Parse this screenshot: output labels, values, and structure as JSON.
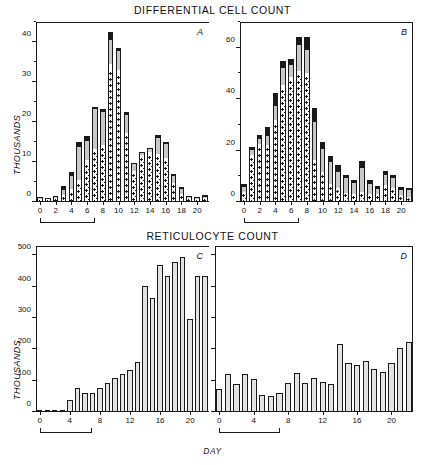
{
  "figure": {
    "top_title": "DIFFERENTIAL CELL COUNT",
    "bottom_title": "RETICULOCYTE COUNT",
    "ylabel_top": "THOUSANDS",
    "ylabel_bottom": "THOUSANDS",
    "xlabel": "DAY",
    "panel_letters": {
      "a": "A",
      "b": "B",
      "c": "C",
      "d": "D"
    }
  },
  "chart_data": [
    {
      "type": "bar",
      "panel": "A",
      "title": "DIFFERENTIAL CELL COUNT",
      "xlabel": "DAY",
      "ylabel": "THOUSANDS",
      "stacked": true,
      "ylim": [
        0,
        45
      ],
      "yticks": [
        0,
        10,
        20,
        30,
        40
      ],
      "yticks_minor": [
        5,
        15,
        25,
        35,
        45
      ],
      "xlim": [
        -0.5,
        21.5
      ],
      "x": [
        0,
        1,
        2,
        3,
        4,
        5,
        6,
        7,
        8,
        9,
        10,
        11,
        12,
        13,
        14,
        15,
        16,
        17,
        18,
        19,
        20,
        21
      ],
      "xticks": [
        0,
        2,
        4,
        6,
        8,
        10,
        12,
        14,
        16,
        18,
        20
      ],
      "grid": false,
      "legend": "none",
      "series": [
        {
          "name": "segment-1-checkered",
          "fill": "checkered",
          "values": [
            0.6,
            0.5,
            0.7,
            1.2,
            2.3,
            4.4,
            9.2,
            12.4,
            13.6,
            32.4,
            31.4,
            16.4,
            7.0,
            11.0,
            11.6,
            11.2,
            10.2,
            4.2,
            1.6,
            0.8,
            0.6,
            0.8
          ]
        },
        {
          "name": "segment-2-white",
          "fill": "white",
          "values": [
            0.2,
            0.2,
            0.3,
            0.5,
            0.9,
            1.0,
            1.2,
            0.8,
            0.6,
            2.0,
            1.6,
            0.8,
            0.8,
            0.7,
            0.9,
            0.9,
            0.8,
            0.6,
            0.4,
            0.2,
            0.2,
            0.2
          ]
        },
        {
          "name": "segment-3-gray",
          "fill": "gray",
          "values": [
            0.2,
            0.2,
            0.3,
            1.3,
            3.2,
            8.4,
            4.8,
            10.0,
            8.4,
            6.2,
            4.8,
            4.6,
            1.6,
            0.5,
            0.7,
            3.8,
            3.6,
            1.8,
            1.2,
            0.2,
            0.2,
            0.2
          ]
        },
        {
          "name": "segment-4-black",
          "fill": "black",
          "values": [
            0.2,
            0.2,
            0.2,
            0.9,
            1.1,
            1.1,
            1.2,
            0.6,
            0.6,
            1.8,
            0.6,
            0.8,
            0.4,
            0.3,
            0.4,
            0.8,
            0.4,
            0.4,
            0.6,
            0.2,
            0.2,
            0.5
          ]
        }
      ],
      "totals": [
        1.2,
        1.1,
        1.5,
        3.9,
        7.5,
        14.9,
        16.4,
        23.8,
        23.2,
        42.4,
        38.4,
        22.6,
        9.8,
        12.5,
        13.6,
        16.7,
        15.0,
        7.0,
        3.8,
        1.4,
        1.2,
        1.7
      ],
      "bracket": {
        "from": 0,
        "to": 7
      }
    },
    {
      "type": "bar",
      "panel": "B",
      "title": "DIFFERENTIAL CELL COUNT",
      "xlabel": "DAY",
      "ylabel": "THOUSANDS",
      "stacked": true,
      "ylim": [
        0,
        70
      ],
      "yticks": [
        0,
        20,
        40,
        60
      ],
      "yticks_minor": [
        10,
        30,
        50,
        70
      ],
      "xlim": [
        -0.5,
        21.5
      ],
      "x": [
        0,
        1,
        2,
        3,
        4,
        5,
        6,
        7,
        8,
        9,
        10,
        11,
        12,
        13,
        14,
        15,
        16,
        17,
        18,
        19,
        20,
        21
      ],
      "xticks": [
        0,
        2,
        4,
        6,
        8,
        10,
        12,
        14,
        16,
        18,
        20
      ],
      "grid": false,
      "legend": "none",
      "series": [
        {
          "name": "segment-1-checkered",
          "fill": "checkered",
          "values": [
            3.2,
            17.0,
            21.0,
            21.0,
            30.0,
            43.5,
            47.0,
            49.5,
            48.5,
            15.0,
            10.5,
            6.0,
            4.5,
            3.0,
            2.5,
            3.0,
            2.5,
            2.5,
            5.5,
            4.5,
            2.0,
            1.5
          ]
        },
        {
          "name": "segment-2-white",
          "fill": "white",
          "values": [
            0.8,
            1.2,
            1.5,
            1.2,
            2.0,
            2.0,
            1.8,
            1.6,
            1.8,
            1.5,
            1.2,
            1.0,
            0.8,
            0.7,
            0.6,
            0.8,
            0.7,
            0.6,
            1.0,
            0.9,
            0.6,
            0.5
          ]
        },
        {
          "name": "segment-3-gray",
          "fill": "gray",
          "values": [
            1.8,
            2.2,
            2.0,
            3.5,
            5.5,
            6.5,
            4.5,
            10.0,
            9.0,
            14.5,
            9.0,
            8.5,
            6.5,
            5.5,
            4.2,
            9.5,
            4.0,
            2.0,
            4.2,
            4.0,
            2.0,
            2.5
          ]
        },
        {
          "name": "segment-4-black",
          "fill": "black",
          "values": [
            1.2,
            1.1,
            1.5,
            3.3,
            5.0,
            3.0,
            2.2,
            3.0,
            5.0,
            5.5,
            2.8,
            2.5,
            2.5,
            1.3,
            1.2,
            2.7,
            1.3,
            1.2,
            1.3,
            1.1,
            1.2,
            1.0
          ]
        }
      ],
      "totals": [
        7.0,
        21.5,
        26.0,
        29.0,
        42.5,
        55.0,
        55.5,
        64.1,
        64.3,
        36.5,
        23.5,
        18.0,
        14.3,
        10.5,
        8.5,
        16.0,
        8.5,
        6.3,
        12.0,
        10.5,
        5.8,
        5.5
      ],
      "bracket": {
        "from": 0,
        "to": 7
      }
    },
    {
      "type": "bar",
      "panel": "C",
      "title": "RETICULOCYTE COUNT",
      "xlabel": "DAY",
      "ylabel": "THOUSANDS",
      "stacked": false,
      "ylim": [
        0,
        530
      ],
      "yticks": [
        0,
        100,
        200,
        300,
        400,
        500
      ],
      "xlim": [
        -0.5,
        21.5
      ],
      "x": [
        0,
        1,
        2,
        3,
        4,
        5,
        6,
        7,
        8,
        9,
        10,
        11,
        12,
        13,
        14,
        15,
        16,
        17,
        18,
        19,
        20,
        21
      ],
      "xticks": [
        0,
        4,
        8,
        12,
        16,
        20
      ],
      "grid": false,
      "legend": "none",
      "values": [
        2,
        2,
        2,
        8,
        38,
        78,
        62,
        62,
        78,
        92,
        110,
        122,
        135,
        160,
        402,
        365,
        470,
        435,
        478,
        495,
        298,
        433,
        435
      ],
      "bracket": {
        "from": 0,
        "to": 7
      }
    },
    {
      "type": "bar",
      "panel": "D",
      "title": "RETICULOCYTE COUNT",
      "xlabel": "DAY",
      "ylabel": "THOUSANDS",
      "stacked": false,
      "ylim": [
        0,
        530
      ],
      "yticks": [
        0,
        100,
        200,
        300,
        400,
        500
      ],
      "yticks_labeled": false,
      "xlim": [
        -0.5,
        21.5
      ],
      "x": [
        0,
        1,
        2,
        3,
        4,
        5,
        6,
        7,
        8,
        9,
        10,
        11,
        12,
        13,
        14,
        15,
        16,
        17,
        18,
        19,
        20,
        21
      ],
      "xticks": [
        0,
        4,
        8,
        12,
        16,
        20
      ],
      "grid": false,
      "legend": "none",
      "values": [
        72,
        120,
        88,
        120,
        105,
        55,
        52,
        60,
        92,
        123,
        92,
        110,
        95,
        90,
        218,
        157,
        150,
        163,
        138,
        128,
        155,
        203,
        222
      ],
      "bracket": {
        "from": 0,
        "to": 7
      }
    }
  ],
  "colors": {
    "ink": "#1a1a1a",
    "gray_fill": "#c9c9c9",
    "plain_fill": "#e3e3e3",
    "white_fill": "#ffffff"
  }
}
